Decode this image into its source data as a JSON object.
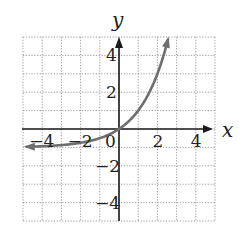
{
  "chart_data": {
    "type": "line",
    "title": "",
    "xlabel": "x",
    "ylabel": "y",
    "xlim": [
      -5,
      5
    ],
    "ylim": [
      -5,
      5
    ],
    "grid": true,
    "grid_style": "dotted",
    "x_ticks": [
      -4,
      -2,
      0,
      2,
      4
    ],
    "y_ticks": [
      4,
      2,
      -2,
      -4
    ],
    "x_tick_labels": [
      "−4",
      "−2",
      "0",
      "2",
      "4"
    ],
    "y_tick_labels": [
      "4",
      "2",
      "−2",
      "−4"
    ],
    "legend": null,
    "series": [
      {
        "name": "y = 2^x − 1",
        "color": "#6e6e6e",
        "x": [
          -4.8,
          -4,
          -3,
          -2,
          -1,
          0,
          0.5,
          1,
          1.5,
          2,
          2.3,
          2.55
        ],
        "values": [
          -0.96,
          -0.94,
          -0.88,
          -0.75,
          -0.5,
          0,
          0.41,
          1,
          1.83,
          3,
          3.92,
          4.86
        ],
        "arrows": "both",
        "asymptote": -1
      }
    ]
  },
  "labels": {
    "x_axis": "x",
    "y_axis": "y",
    "origin": "0"
  },
  "colors": {
    "axis": "#1a1a1a",
    "grid": "#9a9a9a",
    "curve": "#6e6e6e",
    "text": "#222222"
  }
}
